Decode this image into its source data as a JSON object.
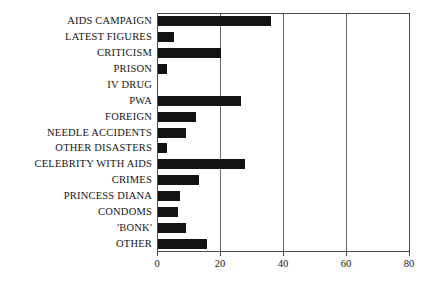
{
  "chart_data": {
    "type": "bar",
    "orientation": "horizontal",
    "title": "",
    "subtitle": "",
    "xlabel": "",
    "ylabel": "",
    "xlim": [
      0,
      80
    ],
    "ylim": null,
    "xticks": [
      0,
      20,
      40,
      60,
      80
    ],
    "xtick_labels": [
      "0",
      "20",
      "40",
      "60",
      "80"
    ],
    "grid": true,
    "grid_axis": "x",
    "legend": false,
    "legend_position": "none",
    "bar_color": "#121212",
    "frame_color": "#4a4a4a",
    "categories": [
      "AIDS CAMPAIGN",
      "LATEST FIGURES",
      "CRITICISM",
      "PRISON",
      "IV DRUG",
      "PWA",
      "FOREIGN",
      "NEEDLE ACCIDENTS",
      "OTHER DISASTERS",
      "CELEBRITY WITH AIDS",
      "CRIMES",
      "PRINCESS DIANA",
      "CONDOMS",
      "'BONK'",
      "OTHER"
    ],
    "values": [
      36,
      5,
      20,
      3,
      0,
      26.5,
      12,
      9,
      3,
      27.5,
      13,
      7,
      6.5,
      9,
      15.5
    ]
  }
}
